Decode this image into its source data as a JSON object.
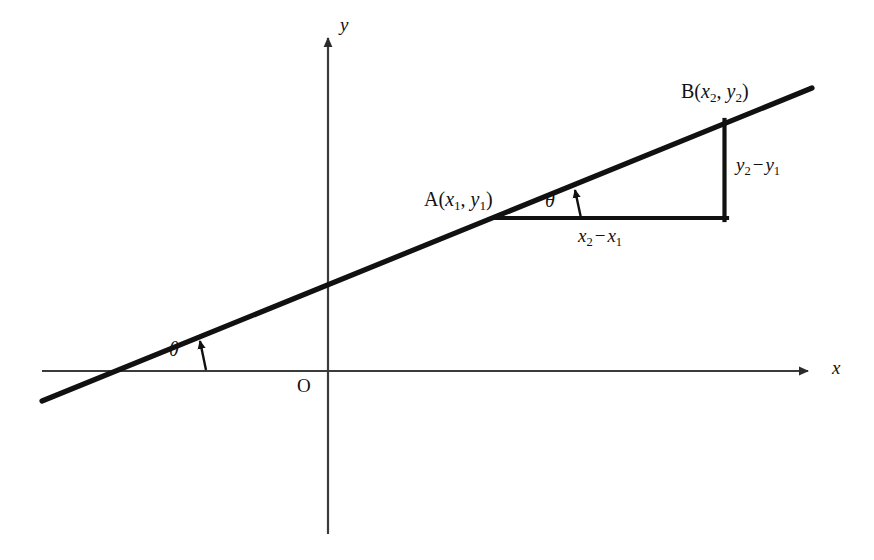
{
  "figure": {
    "kind": "coordinate-geometry-diagram",
    "background_color": "#ffffff",
    "ink_color": "#111111",
    "axis_color": "#3b3b3b"
  },
  "axes": {
    "x_label": "x",
    "y_label": "y",
    "origin_label": "O",
    "x_axis": {
      "x1": 42,
      "y1": 371,
      "x2": 818,
      "y2": 371,
      "arrow": "right"
    },
    "y_axis": {
      "x1": 328,
      "y1": 534,
      "x2": 328,
      "y2": 28,
      "arrow": "up"
    }
  },
  "line": {
    "name": "straight-line",
    "x1": 42,
    "y1": 401,
    "x2": 812,
    "y2": 88,
    "stroke_width": 5
  },
  "points": {
    "A": {
      "label_prefix": "A",
      "open_paren": "(",
      "x_var": "x",
      "x_sub": "1",
      "comma": ", ",
      "y_var": "y",
      "y_sub": "1",
      "close_paren": ")",
      "label_text": "A(x1, y1)",
      "px": 496,
      "py": 218,
      "label_x": 424,
      "label_y": 190
    },
    "B": {
      "label_prefix": "B",
      "open_paren": "(",
      "x_var": "x",
      "x_sub": "2",
      "comma": ", ",
      "y_var": "y",
      "y_sub": "2",
      "close_paren": ")",
      "label_text": "B(x2, y2)",
      "px": 724,
      "py": 123,
      "label_x": 681,
      "label_y": 82
    }
  },
  "triangle": {
    "horizontal_run": {
      "x1": 494,
      "y1": 218,
      "x2": 726,
      "y2": 218
    },
    "vertical_rise": {
      "x1": 724,
      "y1": 121,
      "x2": 724,
      "y2": 220
    }
  },
  "labels": {
    "run": {
      "text": "x2 - x1",
      "first_var": "x",
      "first_sub": "2",
      "operator": "−",
      "second_var": "x",
      "second_sub": "1",
      "x": 578,
      "y": 228
    },
    "rise": {
      "text": "y2 - y1",
      "first_var": "y",
      "first_sub": "2",
      "operator": "−",
      "second_var": "y",
      "second_sub": "1",
      "x": 736,
      "y": 157
    },
    "theta_at_A": {
      "text": "θ",
      "x": 546,
      "y": 192,
      "arrow": {
        "x1": 581,
        "y1": 219,
        "x2": 574,
        "y2": 186
      }
    },
    "theta_at_x_axis": {
      "text": "θ",
      "x": 170,
      "y": 341,
      "arrow": {
        "x1": 206,
        "y1": 370,
        "x2": 199,
        "y2": 337
      }
    },
    "origin": {
      "text": "O",
      "x": 298,
      "y": 379
    },
    "x_axis_label": {
      "text": "x",
      "x": 832,
      "y": 360
    },
    "y_axis_label": {
      "text": "y",
      "x": 340,
      "y": 15
    }
  }
}
